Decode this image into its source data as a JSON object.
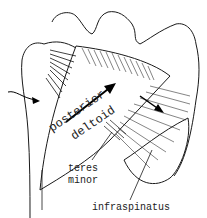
{
  "figure": {
    "labels": {
      "posterior": "posterior",
      "deltoid": "deltoid",
      "teres": "teres",
      "minor": "minor",
      "infraspinatus": "infraspinatus"
    },
    "colors": {
      "ink": "#1a1a1a",
      "background": "#ffffff"
    }
  }
}
